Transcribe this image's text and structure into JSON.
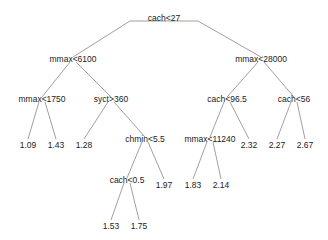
{
  "diagram": {
    "type": "regression-tree",
    "line_color": "#888888",
    "text_color": "#222222",
    "nodes": [
      {
        "id": "n0",
        "label": "cach<27",
        "x": 164,
        "y": 18,
        "kind": "split"
      },
      {
        "id": "n1",
        "label": "mmax<6100",
        "x": 73,
        "y": 59,
        "kind": "split"
      },
      {
        "id": "n2",
        "label": "mmax<28000",
        "x": 261,
        "y": 59,
        "kind": "split"
      },
      {
        "id": "n3",
        "label": "mmax<1750",
        "x": 42,
        "y": 99,
        "kind": "split"
      },
      {
        "id": "n4",
        "label": "syct>360",
        "x": 111,
        "y": 99,
        "kind": "split"
      },
      {
        "id": "n5",
        "label": "cach<96.5",
        "x": 227,
        "y": 99,
        "kind": "split"
      },
      {
        "id": "n6",
        "label": "cach<56",
        "x": 294,
        "y": 99,
        "kind": "split"
      },
      {
        "id": "n7",
        "label": "1.09",
        "x": 28,
        "y": 145,
        "kind": "leaf"
      },
      {
        "id": "n8",
        "label": "1.43",
        "x": 56,
        "y": 145,
        "kind": "leaf"
      },
      {
        "id": "n9",
        "label": "1.28",
        "x": 84,
        "y": 145,
        "kind": "leaf"
      },
      {
        "id": "n10",
        "label": "chmin<5.5",
        "x": 145,
        "y": 139,
        "kind": "split"
      },
      {
        "id": "n11",
        "label": "mmax<11240",
        "x": 210,
        "y": 139,
        "kind": "split"
      },
      {
        "id": "n12",
        "label": "2.32",
        "x": 249,
        "y": 145,
        "kind": "leaf"
      },
      {
        "id": "n13",
        "label": "2.27",
        "x": 277,
        "y": 145,
        "kind": "leaf"
      },
      {
        "id": "n14",
        "label": "2.67",
        "x": 305,
        "y": 145,
        "kind": "leaf"
      },
      {
        "id": "n15",
        "label": "cach<0.5",
        "x": 127,
        "y": 180,
        "kind": "split"
      },
      {
        "id": "n16",
        "label": "1.97",
        "x": 164,
        "y": 185,
        "kind": "leaf"
      },
      {
        "id": "n17",
        "label": "1.83",
        "x": 193,
        "y": 185,
        "kind": "leaf"
      },
      {
        "id": "n18",
        "label": "2.14",
        "x": 221,
        "y": 185,
        "kind": "leaf"
      },
      {
        "id": "n19",
        "label": "1.53",
        "x": 111,
        "y": 226,
        "kind": "leaf"
      },
      {
        "id": "n20",
        "label": "1.75",
        "x": 139,
        "y": 226,
        "kind": "leaf"
      }
    ],
    "edges": [
      {
        "from": "n0",
        "to": "n1"
      },
      {
        "from": "n0",
        "to": "n2"
      },
      {
        "from": "n1",
        "to": "n3"
      },
      {
        "from": "n1",
        "to": "n4"
      },
      {
        "from": "n2",
        "to": "n5"
      },
      {
        "from": "n2",
        "to": "n6"
      },
      {
        "from": "n3",
        "to": "n7"
      },
      {
        "from": "n3",
        "to": "n8"
      },
      {
        "from": "n4",
        "to": "n9"
      },
      {
        "from": "n4",
        "to": "n10"
      },
      {
        "from": "n5",
        "to": "n11"
      },
      {
        "from": "n5",
        "to": "n12"
      },
      {
        "from": "n6",
        "to": "n13"
      },
      {
        "from": "n6",
        "to": "n14"
      },
      {
        "from": "n10",
        "to": "n15"
      },
      {
        "from": "n10",
        "to": "n16"
      },
      {
        "from": "n11",
        "to": "n17"
      },
      {
        "from": "n11",
        "to": "n18"
      },
      {
        "from": "n15",
        "to": "n19"
      },
      {
        "from": "n15",
        "to": "n20"
      }
    ]
  }
}
